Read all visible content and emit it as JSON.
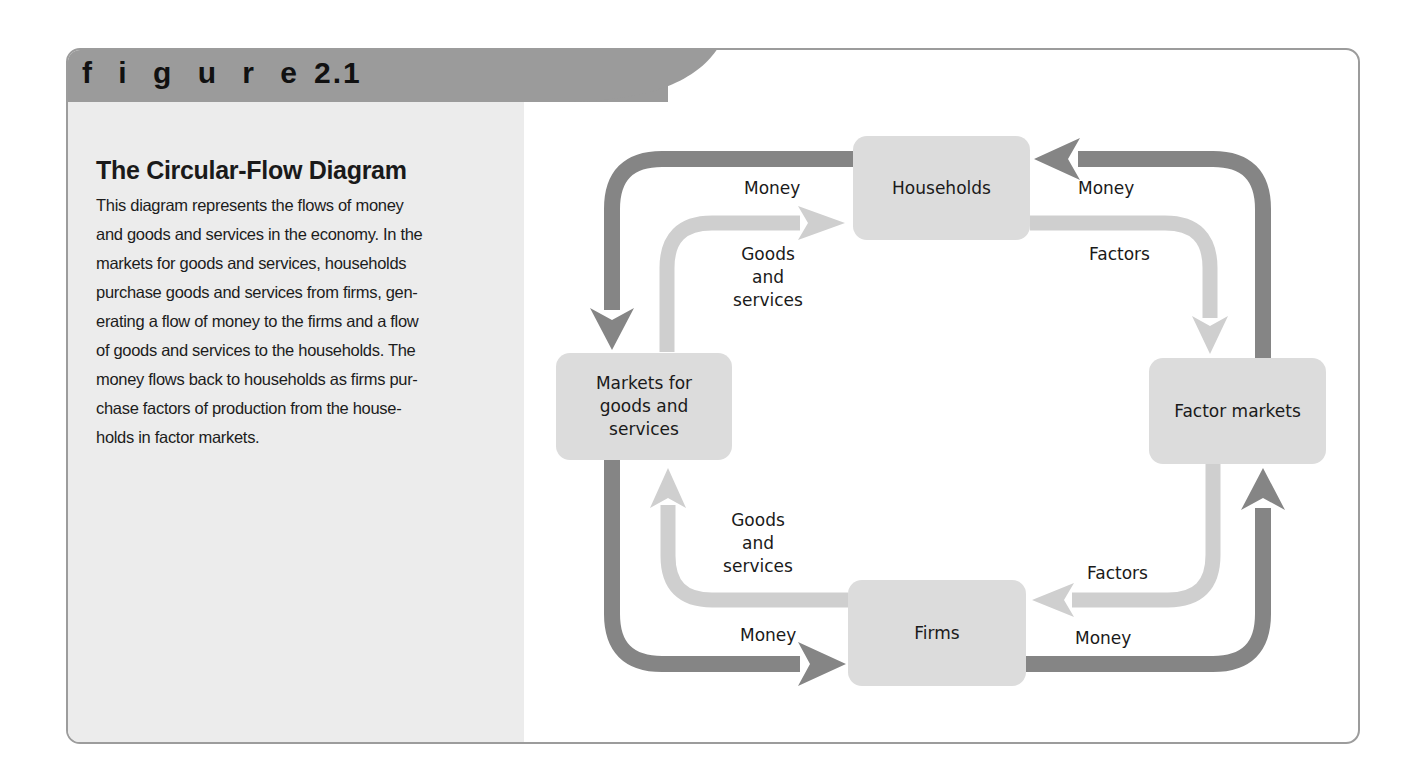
{
  "figure": {
    "label": "f i g u r e",
    "number": "2.1",
    "title": "The Circular-Flow Diagram",
    "caption_lines": [
      "This diagram represents the flows of money",
      "and goods and services in the economy. In the",
      "markets for goods and services, households",
      "purchase goods and services from firms, gen-",
      "erating a flow of money to the firms and a flow",
      "of goods and services to the households. The",
      "money flows back to households as firms pur-",
      "chase factors of production from the house-",
      "holds in factor markets."
    ]
  },
  "diagram": {
    "nodes": {
      "households": "Households",
      "markets_goods": [
        "Markets for",
        "goods and",
        "services"
      ],
      "factor_markets": "Factor markets",
      "firms": "Firms"
    },
    "flows": {
      "money_top_left": "Money",
      "goods_top_left": [
        "Goods",
        "and",
        "services"
      ],
      "money_top_right": "Money",
      "factors_top_right": "Factors",
      "goods_bottom_left": [
        "Goods",
        "and",
        "services"
      ],
      "money_bottom_left": "Money",
      "factors_bottom_right": "Factors",
      "money_bottom_right": "Money"
    },
    "colors": {
      "money_flow": "#858585",
      "goods_factor_flow": "#cfcfcf",
      "node_fill": "#dcdcdc",
      "header": "#9b9b9b",
      "side_panel": "#ececec",
      "frame_border": "#9c9c9c"
    }
  }
}
